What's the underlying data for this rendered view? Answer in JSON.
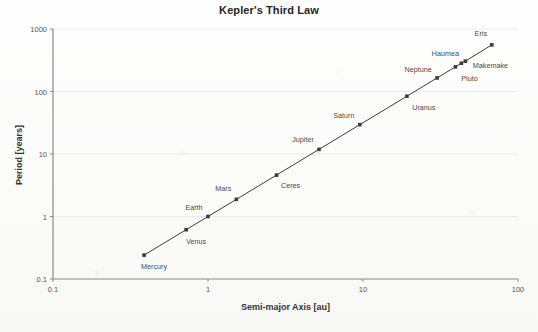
{
  "chart_data": {
    "type": "line",
    "title": "Kepler's Third Law",
    "xlabel": "Semi-major Axis [au]",
    "ylabel": "Period [years]",
    "xscale": "log",
    "yscale": "log",
    "xlim": [
      0.1,
      100
    ],
    "ylim": [
      0.1,
      1000
    ],
    "xticks": [
      "0.1",
      "1",
      "10",
      "100"
    ],
    "yticks": [
      "0.1",
      "1",
      "10",
      "100",
      "1000"
    ],
    "grid": "horizontal major only",
    "legend": "none",
    "marker": "small filled square",
    "line_color": "#3c3c3c",
    "marker_color": "#3c3c3c",
    "grid_color": "#e6e6e6",
    "axis_color": "#8a8a8a",
    "series_name": "Solar System bodies",
    "points": [
      {
        "label": "Mercury",
        "x": 0.387,
        "y": 0.241,
        "label_dx": 10,
        "label_dy": 11
      },
      {
        "label": "Venus",
        "x": 0.723,
        "y": 0.615,
        "label_dx": 10,
        "label_dy": 11
      },
      {
        "label": "Earth",
        "x": 1.0,
        "y": 1.0,
        "label_dx": -14,
        "label_dy": -10
      },
      {
        "label": "Mars",
        "x": 1.524,
        "y": 1.881,
        "label_dx": -13,
        "label_dy": -11
      },
      {
        "label": "Ceres",
        "x": 2.77,
        "y": 4.6,
        "label_dx": 14,
        "label_dy": 10
      },
      {
        "label": "Jupiter",
        "x": 5.203,
        "y": 11.86,
        "label_dx": -16,
        "label_dy": -10
      },
      {
        "label": "Saturn",
        "x": 9.537,
        "y": 29.46,
        "label_dx": -16,
        "label_dy": -10
      },
      {
        "label": "Uranus",
        "x": 19.19,
        "y": 84.02,
        "label_dx": 17,
        "label_dy": 11
      },
      {
        "label": "Neptune",
        "x": 30.07,
        "y": 164.8,
        "label_dx": -19,
        "label_dy": -9
      },
      {
        "label": "Pluto",
        "x": 39.48,
        "y": 248.0,
        "label_dx": 14,
        "label_dy": 11
      },
      {
        "label": "Haumea",
        "x": 43.13,
        "y": 283.3,
        "label_dx": -16,
        "label_dy": -10
      },
      {
        "label": "Makemake",
        "x": 45.79,
        "y": 306.2,
        "label_dx": 25,
        "label_dy": 4
      },
      {
        "label": "Eris",
        "x": 67.78,
        "y": 558.0,
        "label_dx": -11,
        "label_dy": -12
      }
    ]
  }
}
